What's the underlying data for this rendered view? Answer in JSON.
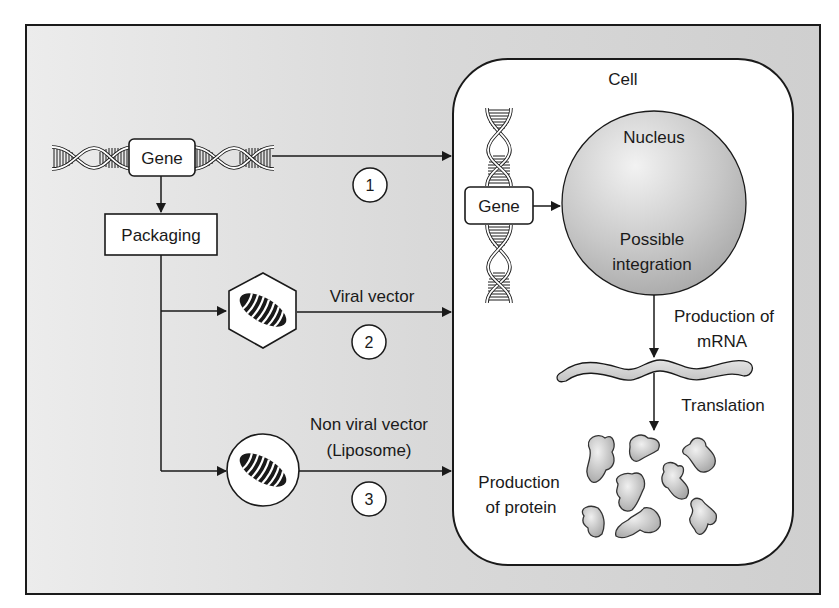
{
  "diagram": {
    "type": "gene-therapy-delivery-flow",
    "colors": {
      "background_panel": "#d6d6d6",
      "cell_fill": "#ffffff",
      "nucleus_fill": "#c4c4c4",
      "protein_fill": "#bdbdbd",
      "stroke": "#1a1a1a"
    },
    "source": {
      "gene_label": "Gene",
      "packaging_label": "Packaging"
    },
    "routes": [
      {
        "number": "1",
        "label": ""
      },
      {
        "number": "2",
        "label": "Viral vector"
      },
      {
        "number": "3",
        "label_line1": "Non viral vector",
        "label_line2": "(Liposome)"
      }
    ],
    "cell": {
      "title": "Cell",
      "gene_label": "Gene",
      "nucleus": {
        "title": "Nucleus",
        "subtitle_line1": "Possible",
        "subtitle_line2": "integration"
      },
      "mrna_step": {
        "line1": "Production of",
        "line2": "mRNA"
      },
      "translation_step": "Translation",
      "protein_step": {
        "line1": "Production",
        "line2": "of protein"
      }
    }
  }
}
